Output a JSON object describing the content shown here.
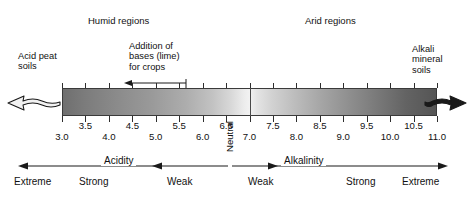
{
  "figure": {
    "title_regions": {
      "humid": "Humid regions",
      "arid": "Arid regions"
    },
    "notes": {
      "acid_peat": "Acid peat\nsoils",
      "acid_peat_line1": "Acid peat",
      "acid_peat_line2": "soils",
      "alkali_line1": "Alkali",
      "alkali_line2": "mineral",
      "alkali_line3": "soils",
      "lime_line1": "Addition of",
      "lime_line2": "bases (lime)",
      "lime_line3": "for crops"
    },
    "axis": {
      "label": "pH",
      "min": 3.0,
      "max": 11.0,
      "step": 0.5,
      "neutral": 7.0,
      "ticks": [
        {
          "value": 3.0,
          "label": "3.0",
          "row": "lo"
        },
        {
          "value": 3.5,
          "label": "3.5",
          "row": "hi"
        },
        {
          "value": 4.0,
          "label": "4.0",
          "row": "lo"
        },
        {
          "value": 4.5,
          "label": "4.5",
          "row": "hi"
        },
        {
          "value": 5.0,
          "label": "5.0",
          "row": "lo"
        },
        {
          "value": 5.5,
          "label": "5.5",
          "row": "hi"
        },
        {
          "value": 6.0,
          "label": "6.0",
          "row": "lo"
        },
        {
          "value": 6.5,
          "label": "6.5",
          "row": "hi"
        },
        {
          "value": 7.0,
          "label": "7.0",
          "row": "lo"
        },
        {
          "value": 7.5,
          "label": "7.5",
          "row": "hi"
        },
        {
          "value": 8.0,
          "label": "8.0",
          "row": "lo"
        },
        {
          "value": 8.5,
          "label": "8.5",
          "row": "hi"
        },
        {
          "value": 9.0,
          "label": "9.0",
          "row": "lo"
        },
        {
          "value": 9.5,
          "label": "9.5",
          "row": "hi"
        },
        {
          "value": 10.0,
          "label": "10.0",
          "row": "lo"
        },
        {
          "value": 10.5,
          "label": "10.5",
          "row": "hi"
        },
        {
          "value": 11.0,
          "label": "11.0",
          "row": "lo"
        }
      ]
    },
    "bands": {
      "acidity": "Acidity",
      "alkalinity": "Alkalinity",
      "neutral": "Neutral",
      "strength": {
        "extreme_acid": "Extreme",
        "strong_acid": "Strong",
        "weak_acid": "Weak",
        "weak_alkali": "Weak",
        "strong_alkali": "Strong",
        "extreme_alkali": "Extreme"
      }
    },
    "gradient": {
      "acid_end_color": "#6f6f6f",
      "neutral_color": "#f2f2f2",
      "alkali_end_color": "#555555",
      "outline_color": "#3a3a3a"
    },
    "icons": {
      "left_end": "wavy-arrow-left-icon",
      "right_end": "wavy-arrow-right-icon",
      "lime_arrow": "arrow-left-icon"
    }
  }
}
